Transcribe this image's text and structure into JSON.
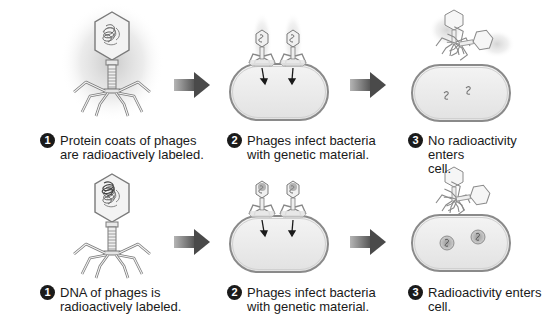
{
  "colors": {
    "text": "#1a1a1a",
    "badge_bg": "#1a1a1a",
    "badge_fg": "#ffffff",
    "arrow_dark": "#5a5a5a",
    "arrow_light": "#b8b8b8",
    "cell_fill": "#ececec",
    "cell_outline": "#8a8a8a",
    "phage_fill": "#f2f2f2",
    "phage_outline": "#888888",
    "radioactive_glow": "#c8c8c8"
  },
  "rows": [
    {
      "label": "protein-coat-labeling",
      "steps": [
        {
          "number": "1",
          "line1": "Protein coats of phages",
          "line2": "are radioactively labeled."
        },
        {
          "number": "2",
          "line1": "Phages infect bacteria",
          "line2": "with genetic material."
        },
        {
          "number": "3",
          "line1": "No radioactivity enters",
          "line2": "cell."
        }
      ]
    },
    {
      "label": "dna-labeling",
      "steps": [
        {
          "number": "1",
          "line1": "DNA of phages is",
          "line2": "radioactively labeled."
        },
        {
          "number": "2",
          "line1": "Phages infect bacteria",
          "line2": "with genetic material."
        },
        {
          "number": "3",
          "line1": "Radioactivity enters",
          "line2": "cell."
        }
      ]
    }
  ]
}
